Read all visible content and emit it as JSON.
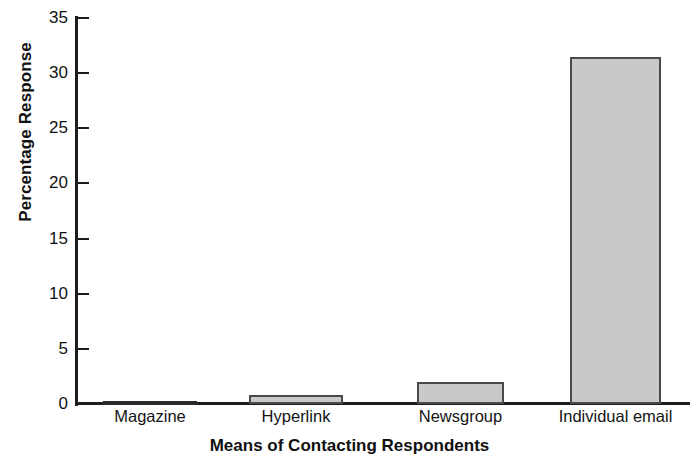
{
  "chart_data": {
    "type": "bar",
    "title": "",
    "xlabel": "Means of Contacting Respondents",
    "ylabel": "Percentage Response",
    "categories": [
      "Magazine",
      "Hyperlink",
      "Newsgroup",
      "Individual email"
    ],
    "values": [
      0.2,
      0.8,
      2.0,
      31.5
    ],
    "ylim": [
      0,
      35
    ],
    "yticks": [
      0,
      5,
      10,
      15,
      20,
      25,
      30,
      35
    ],
    "ytick_labels": [
      "0",
      "5",
      "10",
      "15",
      "20",
      "25",
      "30",
      "35"
    ],
    "grid": false,
    "legend": null,
    "legend_position": "none",
    "bar_fill_color": "#c9c9c9",
    "bar_edge_color": "#4a4a4a",
    "axis_color": "#1d1d1d",
    "background_color": "#ffffff"
  }
}
